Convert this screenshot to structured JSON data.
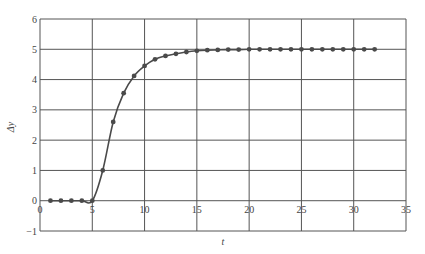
{
  "chart_data": {
    "type": "line",
    "title": "",
    "xlabel": "t",
    "ylabel": "Δy",
    "xlim": [
      0,
      35
    ],
    "ylim": [
      -1,
      6
    ],
    "xticks": [
      0,
      5,
      10,
      15,
      20,
      25,
      30,
      35
    ],
    "yticks": [
      -1,
      0,
      1,
      2,
      3,
      4,
      5,
      6
    ],
    "grid": true,
    "legend": null,
    "series": [
      {
        "name": "Δy",
        "markers": true,
        "x": [
          1,
          2,
          3,
          4,
          5,
          6,
          7,
          8,
          9,
          10,
          11,
          12,
          13,
          14,
          15,
          16,
          17,
          18,
          19,
          20,
          21,
          22,
          23,
          24,
          25,
          26,
          27,
          28,
          29,
          30,
          31,
          32
        ],
        "y": [
          0,
          0,
          0,
          0,
          0,
          1.0,
          2.6,
          3.55,
          4.12,
          4.45,
          4.67,
          4.78,
          4.85,
          4.91,
          4.95,
          4.97,
          4.98,
          4.99,
          4.99,
          5.0,
          5.0,
          5.0,
          5.0,
          5.0,
          5.0,
          5.0,
          5.0,
          5.0,
          5.0,
          5.0,
          5.0,
          5.0
        ]
      }
    ]
  },
  "axes": {
    "x_label": "t",
    "y_label": "Δy"
  },
  "colors": {
    "line": "#4a4a4a",
    "marker": "#4a4a4a",
    "grid": "#555555",
    "text": "#444444"
  }
}
